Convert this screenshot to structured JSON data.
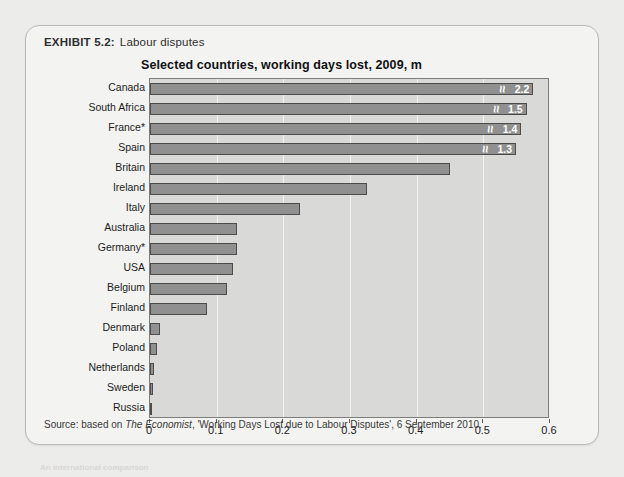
{
  "exhibit": {
    "number_label": "EXHIBIT 5.2:",
    "title": "Labour disputes",
    "source": {
      "prefix": "Source: based on ",
      "italic": "The Economist",
      "suffix": ", 'Working Days Lost due to Labour Disputes', 6 September 2010."
    }
  },
  "colors": {
    "page_background": "#ececeb",
    "panel_background": "#f3f3f1",
    "plot_background": "#d9d9d7",
    "bar_fill": "#909090",
    "bar_outline": "#4c4c4c",
    "gridline": "#f2f2f0",
    "value_label": "#ffffff"
  },
  "chart_data": {
    "type": "bar",
    "orientation": "horizontal",
    "title": "Selected countries, working days lost, 2009, m",
    "xlabel": "",
    "ylabel": "",
    "xlim": [
      0,
      0.6
    ],
    "xticks": [
      0,
      0.1,
      0.2,
      0.3,
      0.4,
      0.5,
      0.6
    ],
    "xticklabels": [
      "0",
      "0.1",
      "0.2",
      "0.3",
      "0.4",
      "0.5",
      "0.6"
    ],
    "grid": true,
    "legend": false,
    "note": "Top four bars are truncated with axis-break marks; their true values are printed inside the bars.",
    "categories": [
      "Canada",
      "South Africa",
      "France*",
      "Spain",
      "Britain",
      "Ireland",
      "Italy",
      "Australia",
      "Germany*",
      "USA",
      "Belgium",
      "Finland",
      "Denmark",
      "Poland",
      "Netherlands",
      "Sweden",
      "Russia"
    ],
    "values": [
      2.2,
      1.5,
      1.4,
      1.3,
      0.45,
      0.325,
      0.225,
      0.13,
      0.13,
      0.125,
      0.115,
      0.085,
      0.015,
      0.011,
      0.006,
      0.004,
      0.0
    ],
    "bars": [
      {
        "category": "Canada",
        "value": 2.2,
        "plot_length": 0.575,
        "broken": true,
        "value_label": "2.2"
      },
      {
        "category": "South Africa",
        "value": 1.5,
        "plot_length": 0.565,
        "broken": true,
        "value_label": "1.5"
      },
      {
        "category": "France*",
        "value": 1.4,
        "plot_length": 0.557,
        "broken": true,
        "value_label": "1.4"
      },
      {
        "category": "Spain",
        "value": 1.3,
        "plot_length": 0.549,
        "broken": true,
        "value_label": "1.3"
      },
      {
        "category": "Britain",
        "value": 0.45,
        "plot_length": 0.45,
        "broken": false,
        "value_label": ""
      },
      {
        "category": "Ireland",
        "value": 0.325,
        "plot_length": 0.325,
        "broken": false,
        "value_label": ""
      },
      {
        "category": "Italy",
        "value": 0.225,
        "plot_length": 0.225,
        "broken": false,
        "value_label": ""
      },
      {
        "category": "Australia",
        "value": 0.13,
        "plot_length": 0.13,
        "broken": false,
        "value_label": ""
      },
      {
        "category": "Germany*",
        "value": 0.13,
        "plot_length": 0.13,
        "broken": false,
        "value_label": ""
      },
      {
        "category": "USA",
        "value": 0.125,
        "plot_length": 0.125,
        "broken": false,
        "value_label": ""
      },
      {
        "category": "Belgium",
        "value": 0.115,
        "plot_length": 0.115,
        "broken": false,
        "value_label": ""
      },
      {
        "category": "Finland",
        "value": 0.085,
        "plot_length": 0.085,
        "broken": false,
        "value_label": ""
      },
      {
        "category": "Denmark",
        "value": 0.015,
        "plot_length": 0.015,
        "broken": false,
        "value_label": ""
      },
      {
        "category": "Poland",
        "value": 0.011,
        "plot_length": 0.011,
        "broken": false,
        "value_label": ""
      },
      {
        "category": "Netherlands",
        "value": 0.006,
        "plot_length": 0.006,
        "broken": false,
        "value_label": ""
      },
      {
        "category": "Sweden",
        "value": 0.004,
        "plot_length": 0.004,
        "broken": false,
        "value_label": ""
      },
      {
        "category": "Russia",
        "value": 0.0,
        "plot_length": 0.0,
        "broken": false,
        "value_label": ""
      }
    ]
  },
  "ghost_text": [
    {
      "text": "Going International 5.2",
      "x": 352,
      "y": 22,
      "size": 15
    },
    {
      "text": "SOU",
      "x": 352,
      "y": 58,
      "size": 15
    },
    {
      "text": "Why do some countries lose more working days to",
      "x": 330,
      "y": 318,
      "size": 8
    },
    {
      "text": "industrial action than others?",
      "x": 330,
      "y": 333,
      "size": 8
    },
    {
      "text": "An international comparison",
      "x": 40,
      "y": 463,
      "size": 8
    }
  ]
}
